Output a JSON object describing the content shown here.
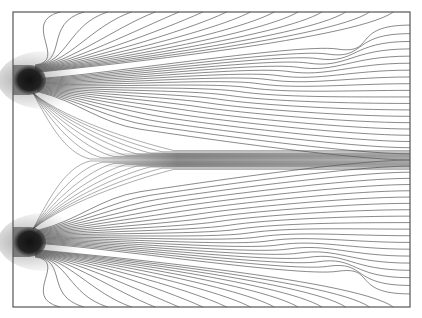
{
  "figure": {
    "type": "field-line-plot",
    "frame": {
      "x0": 13,
      "y0": 12,
      "x1": 410,
      "y1": 307
    },
    "colors": {
      "line": "#3a3a3a",
      "frame": "#555555",
      "source": "#222222",
      "band": "#6a6a6a"
    },
    "sources": [
      {
        "name": "upper-source",
        "cx": 29,
        "cy": 80,
        "rx": 17,
        "ry": 15
      },
      {
        "name": "lower-source",
        "cx": 29,
        "cy": 242,
        "rx": 17,
        "ry": 15
      }
    ],
    "central_band": {
      "y": 160,
      "x_start": 100,
      "x_end": 410,
      "half_width": 7
    },
    "lines_per_source": 36
  }
}
